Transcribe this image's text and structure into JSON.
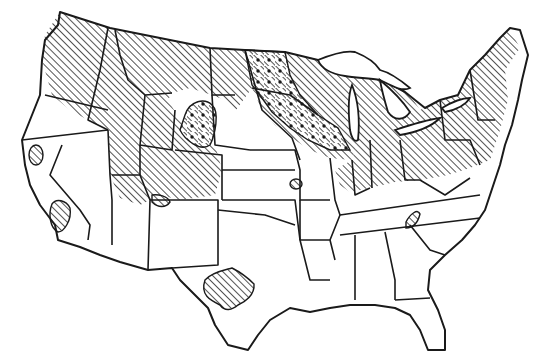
{
  "map": {
    "title": "Contiguous United States — shaded distribution map",
    "style": "black-and-white line map",
    "colors": {
      "ink": "#1a1a1a",
      "background": "#ffffff"
    },
    "legend_visible": false,
    "patterns": [
      {
        "name": "diagonal-hatch",
        "meaning": "primary range (hatched)"
      },
      {
        "name": "dots-over-hatch",
        "meaning": "secondary/overlay zone (dotted)"
      }
    ],
    "hatched_regions": [
      "Washington (eastern & northern)",
      "Oregon (north-central)",
      "Idaho",
      "Montana",
      "Wyoming",
      "Utah (northern)",
      "Colorado (northern)",
      "North Dakota (eastern)",
      "South Dakota (eastern)",
      "Nebraska (eastern band)",
      "Minnesota",
      "Iowa (northern)",
      "Wisconsin",
      "Michigan",
      "Illinois",
      "Indiana",
      "Ohio",
      "Pennsylvania",
      "New York",
      "New England",
      "New Jersey",
      "West Virginia (northern)",
      "Kentucky (northern)",
      "Maryland / Delaware"
    ],
    "dotted_regions": [
      "Eastern Dakotas / western Minnesota band",
      "Northern Iowa / southern Minnesota",
      "Southwestern South Dakota (Black Hills area)"
    ],
    "isolated_patches": [
      "Northern California (small oval)",
      "Southern California (small patch)",
      "Central Texas (Edwards Plateau)",
      "Northeast Tennessee / western NC border",
      "Northern Missouri (small)",
      "Southern Colorado / northern New Mexico border (small)"
    ]
  }
}
